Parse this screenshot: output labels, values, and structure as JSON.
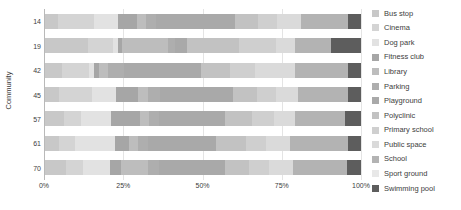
{
  "chart_data": {
    "type": "bar",
    "subtype": "horizontal-stacked-100-percent",
    "title": "",
    "xlabel": "",
    "ylabel": "Community",
    "xlim": [
      0,
      100
    ],
    "xticks": [
      0,
      25,
      50,
      75,
      100
    ],
    "xtick_labels": [
      "0%",
      "25%",
      "50%",
      "75%",
      "100%"
    ],
    "grid": true,
    "legend_position": "right",
    "categories": [
      "14",
      "19",
      "42",
      "45",
      "57",
      "61",
      "70"
    ],
    "series": [
      {
        "name": "Bus stop",
        "color": "#c8c8c8",
        "values": [
          4.0,
          13.5,
          5.5,
          4.5,
          6.0,
          4.5,
          6.5
        ]
      },
      {
        "name": "Cinema",
        "color": "#d4d4d4",
        "values": [
          11.5,
          8.0,
          8.5,
          10.5,
          5.5,
          5.0,
          5.5
        ]
      },
      {
        "name": "Dog park",
        "color": "#e2e2e2",
        "values": [
          7.5,
          1.5,
          1.5,
          7.5,
          9.5,
          12.5,
          8.5
        ]
      },
      {
        "name": "Fitness club",
        "color": "#a6a6a6",
        "values": [
          6.0,
          1.5,
          1.5,
          7.0,
          9.0,
          4.5,
          3.5
        ]
      },
      {
        "name": "Library",
        "color": "#bdbdbd",
        "values": [
          3.0,
          14.5,
          3.0,
          3.0,
          3.0,
          3.0,
          8.5
        ]
      },
      {
        "name": "Parking",
        "color": "#aeaeae",
        "values": [
          3.0,
          2.0,
          5.0,
          4.0,
          3.0,
          3.0,
          3.5
        ]
      },
      {
        "name": "Playground",
        "color": "#a9a9a9",
        "values": [
          25.0,
          4.0,
          24.5,
          23.0,
          21.0,
          21.5,
          21.0
        ]
      },
      {
        "name": "Polyclinic",
        "color": "#c2c2c2",
        "values": [
          7.5,
          16.5,
          9.0,
          7.5,
          8.5,
          9.5,
          7.5
        ]
      },
      {
        "name": "Primary school",
        "color": "#cfcfcf",
        "values": [
          6.0,
          11.5,
          8.0,
          6.0,
          7.0,
          6.5,
          6.5
        ]
      },
      {
        "name": "Public space",
        "color": "#dadada",
        "values": [
          7.5,
          6.0,
          12.5,
          7.0,
          6.5,
          7.5,
          7.5
        ]
      },
      {
        "name": "School",
        "color": "#b3b3b3",
        "values": [
          15.0,
          11.5,
          17.0,
          16.0,
          16.0,
          18.5,
          17.0
        ]
      },
      {
        "name": "Swimming pool",
        "color": "#5d5d5d",
        "values": [
          4.0,
          9.5,
          4.0,
          4.0,
          5.0,
          4.0,
          4.5
        ]
      }
    ]
  },
  "legend": {
    "items": [
      {
        "label": "Bus stop"
      },
      {
        "label": "Cinema"
      },
      {
        "label": "Dog park"
      },
      {
        "label": "Fitness club"
      },
      {
        "label": "Library"
      },
      {
        "label": "Parking"
      },
      {
        "label": "Playground"
      },
      {
        "label": "Polyclinic"
      },
      {
        "label": "Primary school"
      },
      {
        "label": "Public space"
      },
      {
        "label": "School"
      },
      {
        "label": "Sport ground"
      },
      {
        "label": "Swimming pool"
      }
    ]
  },
  "legend_colors": {
    "Bus stop": "#c8c8c8",
    "Cinema": "#d4d4d4",
    "Dog park": "#e2e2e2",
    "Fitness club": "#a6a6a6",
    "Library": "#bdbdbd",
    "Parking": "#aeaeae",
    "Playground": "#a9a9a9",
    "Polyclinic": "#c2c2c2",
    "Primary school": "#cfcfcf",
    "Public space": "#dadada",
    "School": "#b3b3b3",
    "Sport ground": "#e8e8e8",
    "Swimming pool": "#5d5d5d"
  },
  "axis": {
    "y_title": "Community"
  }
}
